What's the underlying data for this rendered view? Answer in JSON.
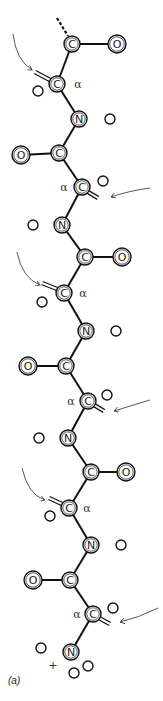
{
  "figure": {
    "panel_label": "(a)",
    "charge_label": "+",
    "alpha_symbol": "α",
    "colors": {
      "line": "#111111",
      "arrow": "#444444",
      "background": "#ffffff"
    }
  },
  "atoms": [
    {
      "id": "c1",
      "element": "C",
      "x": 72,
      "y": 44,
      "r": 8
    },
    {
      "id": "o1",
      "element": "O",
      "x": 117,
      "y": 44,
      "r": 9
    },
    {
      "id": "ca1",
      "element": "C",
      "x": 57,
      "y": 84,
      "r": 8,
      "alpha": true
    },
    {
      "id": "n1",
      "element": "N",
      "x": 79,
      "y": 119,
      "r": 8
    },
    {
      "id": "c2",
      "element": "C",
      "x": 59,
      "y": 153,
      "r": 8
    },
    {
      "id": "o2",
      "element": "O",
      "x": 21,
      "y": 155,
      "r": 9
    },
    {
      "id": "ca2",
      "element": "C",
      "x": 82,
      "y": 187,
      "r": 8,
      "alpha": true
    },
    {
      "id": "n2",
      "element": "N",
      "x": 62,
      "y": 225,
      "r": 8
    },
    {
      "id": "c3",
      "element": "C",
      "x": 85,
      "y": 257,
      "r": 8
    },
    {
      "id": "o3",
      "element": "O",
      "x": 122,
      "y": 257,
      "r": 9
    },
    {
      "id": "ca3",
      "element": "C",
      "x": 64,
      "y": 293,
      "r": 8,
      "alpha": true
    },
    {
      "id": "n3",
      "element": "N",
      "x": 86,
      "y": 331,
      "r": 8
    },
    {
      "id": "c4",
      "element": "C",
      "x": 66,
      "y": 366,
      "r": 8
    },
    {
      "id": "o4",
      "element": "O",
      "x": 28,
      "y": 366,
      "r": 9
    },
    {
      "id": "ca4",
      "element": "C",
      "x": 88,
      "y": 401,
      "r": 8,
      "alpha": true
    },
    {
      "id": "n4",
      "element": "N",
      "x": 68,
      "y": 438,
      "r": 8
    },
    {
      "id": "c5",
      "element": "C",
      "x": 91,
      "y": 472,
      "r": 8
    },
    {
      "id": "o5",
      "element": "O",
      "x": 126,
      "y": 472,
      "r": 9
    },
    {
      "id": "ca5",
      "element": "C",
      "x": 69,
      "y": 508,
      "r": 8,
      "alpha": true
    },
    {
      "id": "n5",
      "element": "N",
      "x": 91,
      "y": 545,
      "r": 8
    },
    {
      "id": "c6",
      "element": "C",
      "x": 70,
      "y": 580,
      "r": 8
    },
    {
      "id": "o6",
      "element": "O",
      "x": 33,
      "y": 580,
      "r": 9
    },
    {
      "id": "ca6",
      "element": "C",
      "x": 93,
      "y": 614,
      "r": 8,
      "alpha": true
    },
    {
      "id": "n6",
      "element": "N",
      "x": 71,
      "y": 652,
      "r": 8
    }
  ],
  "hydrogens": [
    {
      "x": 38,
      "y": 91
    },
    {
      "x": 110,
      "y": 119
    },
    {
      "x": 103,
      "y": 181
    },
    {
      "x": 33,
      "y": 225
    },
    {
      "x": 42,
      "y": 302
    },
    {
      "x": 116,
      "y": 331
    },
    {
      "x": 107,
      "y": 395
    },
    {
      "x": 39,
      "y": 438
    },
    {
      "x": 50,
      "y": 516
    },
    {
      "x": 121,
      "y": 545
    },
    {
      "x": 113,
      "y": 608
    },
    {
      "x": 41,
      "y": 648
    },
    {
      "x": 88,
      "y": 666
    },
    {
      "x": 74,
      "y": 673
    }
  ],
  "bonds": [
    [
      "c1",
      "o1"
    ],
    [
      "c1",
      "ca1"
    ],
    [
      "ca1",
      "n1"
    ],
    [
      "n1",
      "c2"
    ],
    [
      "c2",
      "o2"
    ],
    [
      "c2",
      "ca2"
    ],
    [
      "ca2",
      "n2"
    ],
    [
      "n2",
      "c3"
    ],
    [
      "c3",
      "o3"
    ],
    [
      "c3",
      "ca3"
    ],
    [
      "ca3",
      "n3"
    ],
    [
      "n3",
      "c4"
    ],
    [
      "c4",
      "o4"
    ],
    [
      "c4",
      "ca4"
    ],
    [
      "ca4",
      "n4"
    ],
    [
      "n4",
      "c5"
    ],
    [
      "c5",
      "o5"
    ],
    [
      "c5",
      "ca5"
    ],
    [
      "ca5",
      "n5"
    ],
    [
      "n5",
      "c6"
    ],
    [
      "c6",
      "o6"
    ],
    [
      "c6",
      "ca6"
    ],
    [
      "ca6",
      "n6"
    ]
  ],
  "alpha_labels": [
    {
      "x": 78,
      "y": 84
    },
    {
      "x": 64,
      "y": 187
    },
    {
      "x": 83,
      "y": 293
    },
    {
      "x": 71,
      "y": 401
    },
    {
      "x": 87,
      "y": 508
    },
    {
      "x": 77,
      "y": 614
    }
  ],
  "side_chains": [
    {
      "x1": 50,
      "y1": 80,
      "x2": 35,
      "y2": 72
    },
    {
      "x1": 88,
      "y1": 192,
      "x2": 98,
      "y2": 198
    },
    {
      "x1": 57,
      "y1": 289,
      "x2": 42,
      "y2": 283
    },
    {
      "x1": 94,
      "y1": 405,
      "x2": 104,
      "y2": 411
    },
    {
      "x1": 62,
      "y1": 504,
      "x2": 49,
      "y2": 498
    },
    {
      "x1": 99,
      "y1": 618,
      "x2": 110,
      "y2": 624
    }
  ],
  "arrows": [
    {
      "d": "M13,34 Q16,60 32,70",
      "side": "left"
    },
    {
      "d": "M150,188 Q128,191 111,197",
      "side": "right"
    },
    {
      "d": "M17,252 Q22,278 40,285",
      "side": "left"
    },
    {
      "d": "M150,400 Q130,406 114,411",
      "side": "right"
    },
    {
      "d": "M22,468 Q28,495 45,500",
      "side": "left"
    },
    {
      "d": "M158,608 Q138,618 120,622",
      "side": "right"
    }
  ],
  "chain_terminus": {
    "x1": 57,
    "y1": 18,
    "x2": 68,
    "y2": 36
  },
  "plus_position": {
    "x": 53,
    "y": 665
  },
  "panel_position": {
    "x": 8,
    "y": 684
  }
}
